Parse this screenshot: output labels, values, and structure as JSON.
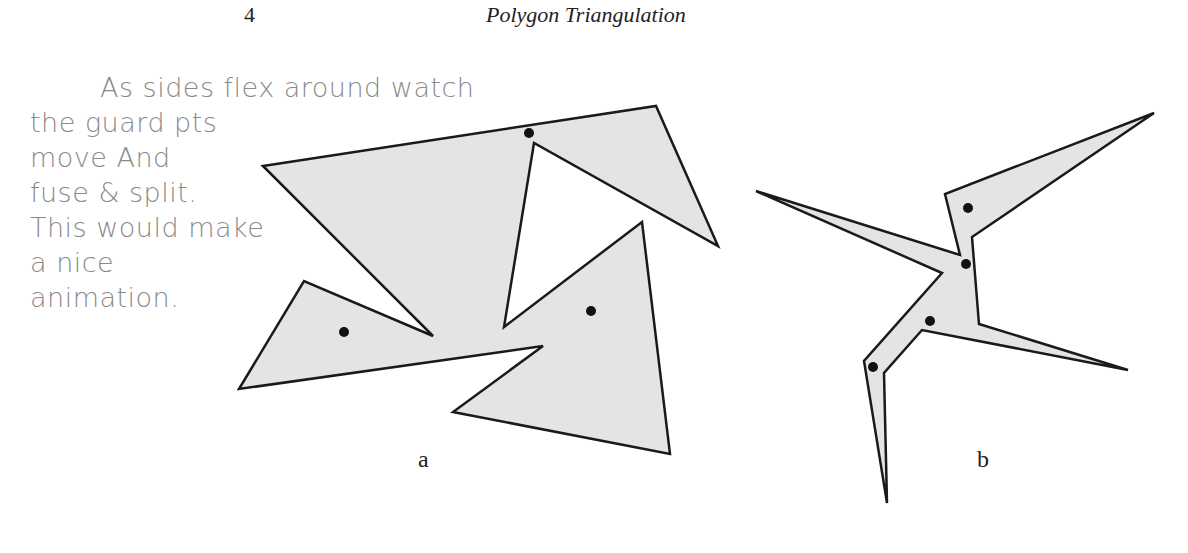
{
  "header": {
    "page_number": "4",
    "running_title": "Polygon Triangulation"
  },
  "handwritten_note": {
    "lines": [
      "As sides flex around watch",
      "the guard pts",
      "move And",
      "fuse & split.",
      "This would make",
      "a nice",
      "animation."
    ],
    "color": "#8a8a8a"
  },
  "figures": [
    {
      "label": "a",
      "fill": "#e4e4e4",
      "stroke": "#1a1a1a",
      "polygon_points": "263,166 656,106 718,246 534,143 504,327 642,222 670,454 453,412 543,346 239,389 304,281 433,336",
      "guard_points": [
        [
          529,
          133
        ],
        [
          344,
          332
        ],
        [
          591,
          311
        ]
      ]
    },
    {
      "label": "b",
      "fill": "#e4e4e4",
      "stroke": "#1a1a1a",
      "polygon_points": "756,191 960,255 945,194 1154,113 972,237 979,324 1128,370 922,330 884,373 887,503 864,361 942,273",
      "guard_points": [
        [
          968,
          208
        ],
        [
          966,
          264
        ],
        [
          930,
          321
        ],
        [
          873,
          367
        ]
      ]
    }
  ]
}
